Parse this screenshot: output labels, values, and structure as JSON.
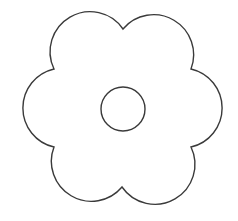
{
  "drawing": {
    "subject": "flower-outline",
    "petal_count": 6,
    "stroke_color": "#3a3a3a",
    "fill_color": "#ffffff",
    "background": "#ffffff",
    "stroke_width": "1.4",
    "outline_path": "M123 29 A40 40 0 0 0 54 69 A40 40 0 0 0 54 147 A40 40 0 0 0 122 187 A40 40 0 0 0 191 147 A40 40 0 0 0 191 69 A40 40 0 0 0 123 29 Z",
    "center": {
      "cx": "123",
      "cy": "109",
      "r": "22"
    }
  }
}
